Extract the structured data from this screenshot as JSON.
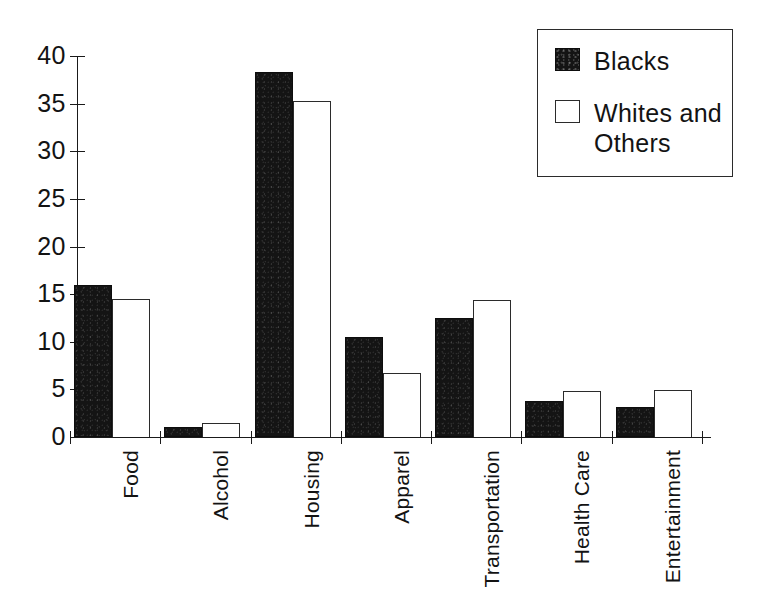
{
  "chart_data": {
    "type": "bar",
    "title": "",
    "subtitle": "",
    "xlabel": "",
    "ylabel": "",
    "ylim": [
      0,
      40
    ],
    "yticks": [
      0,
      5,
      10,
      15,
      20,
      25,
      30,
      35,
      40
    ],
    "ytick_labels": [
      "0",
      "5",
      "10",
      "15",
      "20",
      "25",
      "30",
      "35",
      "40"
    ],
    "grid": false,
    "legend_position": "top-right",
    "categories": [
      "Food",
      "Alcohol",
      "Housing",
      "Apparel",
      "Transportation",
      "Health Care",
      "Entertainment"
    ],
    "series": [
      {
        "name": "Blacks",
        "color": "#141414",
        "fill": "solid-black",
        "values": [
          16.0,
          1.0,
          38.3,
          10.5,
          12.5,
          3.8,
          3.2
        ]
      },
      {
        "name": "Whites and Others",
        "color": "#ffffff",
        "fill": "white-outline",
        "values": [
          14.5,
          1.5,
          35.3,
          6.7,
          14.4,
          4.8,
          4.9
        ]
      }
    ]
  },
  "legend": {
    "entries": [
      {
        "label": "Blacks",
        "swatch": "solid-black-swatch"
      },
      {
        "label": "Whites and Others",
        "swatch": "white-outline-swatch"
      }
    ]
  },
  "axes": {
    "y_tick_labels": [
      "40",
      "35",
      "30",
      "25",
      "20",
      "15",
      "10",
      "5",
      "0"
    ],
    "x_category_labels": [
      "Food",
      "Alcohol",
      "Housing",
      "Apparel",
      "Transportation",
      "Health Care",
      "Entertainment"
    ]
  }
}
